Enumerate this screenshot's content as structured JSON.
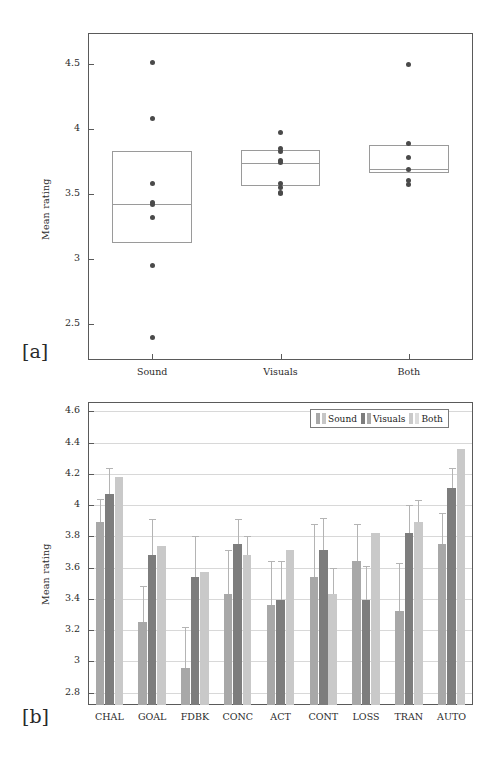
{
  "figure": {
    "panel_a_label": "[a]",
    "panel_b_label": "[b]"
  },
  "colors": {
    "sound": "#a8a8a8",
    "visuals": "#7d7d7d",
    "both": "#c9c9c9",
    "axis": "#5a5a5a",
    "grid": "#d8d8d8",
    "dot": "#4a4a4a",
    "box": "#9a9a9a",
    "error": "#b4b4b4"
  },
  "chart_data": [
    {
      "type": "box",
      "title": "",
      "xlabel": "",
      "ylabel": "Mean rating",
      "categories": [
        "Sound",
        "Visuals",
        "Both"
      ],
      "yticks": [
        2.5,
        3,
        3.5,
        4,
        4.5
      ],
      "yticklabels": [
        "2.5",
        "3",
        "3.5",
        "4",
        "4.5"
      ],
      "ylim": [
        2.22,
        4.74
      ],
      "grid": false,
      "legend": "none",
      "boxes": [
        {
          "name": "Sound",
          "q1": 3.12,
          "median": 3.42,
          "q3": 3.83,
          "points": [
            4.51,
            4.08,
            3.58,
            3.43,
            3.42,
            3.32,
            2.95,
            2.39
          ]
        },
        {
          "name": "Visuals",
          "q1": 3.56,
          "median": 3.74,
          "q3": 3.84,
          "points": [
            3.97,
            3.85,
            3.83,
            3.76,
            3.74,
            3.58,
            3.55,
            3.51,
            3.5
          ]
        },
        {
          "name": "Both",
          "q1": 3.66,
          "median": 3.69,
          "q3": 3.88,
          "points": [
            4.5,
            3.89,
            3.78,
            3.69,
            3.6,
            3.57
          ]
        }
      ]
    },
    {
      "type": "bar",
      "title": "",
      "xlabel": "",
      "ylabel": "Mean rating",
      "categories": [
        "CHAL",
        "GOAL",
        "FDBK",
        "CONC",
        "ACT",
        "CONT",
        "LOSS",
        "TRAN",
        "AUTO"
      ],
      "yticks": [
        2.8,
        3,
        3.2,
        3.4,
        3.6,
        3.8,
        4,
        4.2,
        4.4,
        4.6
      ],
      "yticklabels": [
        "2.8",
        "3",
        "3.2",
        "3.4",
        "3.6",
        "3.8",
        "4",
        "4.2",
        "4.4",
        "4.6"
      ],
      "ylim": [
        2.72,
        4.66
      ],
      "grid": true,
      "legend_position": "top-right",
      "series": [
        {
          "name": "Sound",
          "values": [
            3.89,
            3.25,
            2.96,
            3.43,
            3.36,
            3.54,
            3.64,
            3.32,
            3.75
          ],
          "errors": [
            0.15,
            0.23,
            0.26,
            0.28,
            0.28,
            0.34,
            0.24,
            0.31,
            0.2
          ]
        },
        {
          "name": "Visuals",
          "values": [
            4.07,
            3.68,
            3.54,
            3.75,
            3.39,
            3.71,
            3.39,
            3.82,
            4.11
          ],
          "errors": [
            0.17,
            0.23,
            0.26,
            0.16,
            0.25,
            0.21,
            0.22,
            0.18,
            0.13
          ]
        },
        {
          "name": "Both",
          "values": [
            4.18,
            3.74,
            3.57,
            3.68,
            3.71,
            3.43,
            3.82,
            3.89,
            4.36
          ],
          "errors": [
            0.0,
            0.0,
            0.0,
            0.12,
            0.0,
            0.17,
            0.0,
            0.14,
            0.0
          ]
        }
      ],
      "legend": [
        "Sound",
        "Visuals",
        "Both"
      ]
    }
  ]
}
